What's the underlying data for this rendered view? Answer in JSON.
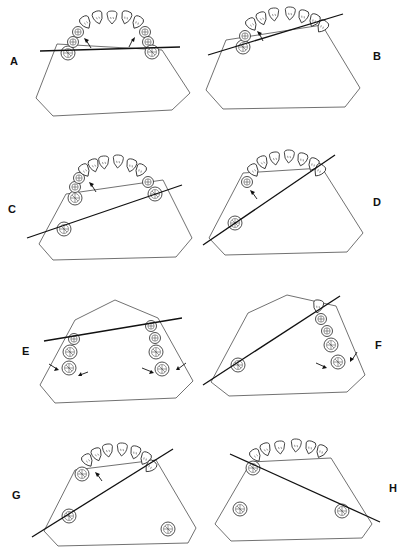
{
  "figure": {
    "panels": [
      {
        "id": "A",
        "label": "A",
        "position": "top-left",
        "line_from": [
          40,
          51
        ],
        "line_to": [
          180,
          47
        ],
        "arrows": 2,
        "arch": "full"
      },
      {
        "id": "B",
        "label": "B",
        "position": "top-right",
        "line_from": [
          208,
          55
        ],
        "line_to": [
          343,
          14
        ],
        "arrows": 1,
        "arch": "full"
      },
      {
        "id": "C",
        "label": "C",
        "position": "row2-left",
        "line_from": [
          27,
          238
        ],
        "line_to": [
          182,
          185
        ],
        "arrows": 1,
        "arch": "full-with-isolated-molar"
      },
      {
        "id": "D",
        "label": "D",
        "position": "row2-right",
        "line_from": [
          203,
          245
        ],
        "line_to": [
          335,
          155
        ],
        "arrows": 1,
        "arch": "anterior-with-isolated-molar"
      },
      {
        "id": "E",
        "label": "E",
        "position": "row3-left",
        "line_from": [
          44,
          341
        ],
        "line_to": [
          182,
          318
        ],
        "arrows": 4,
        "arch": "bilateral-posterior-segments"
      },
      {
        "id": "F",
        "label": "F",
        "position": "row3-right",
        "line_from": [
          203,
          385
        ],
        "line_to": [
          340,
          296
        ],
        "arrows": 2,
        "arch": "unilateral-posterior-with-isolated-molar"
      },
      {
        "id": "G",
        "label": "G",
        "position": "bottom-left",
        "line_from": [
          32,
          537
        ],
        "line_to": [
          173,
          449
        ],
        "arrows": 1,
        "arch": "anterior-with-two-isolated-molars"
      },
      {
        "id": "H",
        "label": "H",
        "position": "bottom-right",
        "line_from": [
          230,
          454
        ],
        "line_to": [
          380,
          522
        ],
        "arrows": 0,
        "arch": "anterior-with-two-isolated-molars"
      }
    ]
  },
  "labels": {
    "A": "A",
    "B": "B",
    "C": "C",
    "D": "D",
    "E": "E",
    "F": "F",
    "G": "G",
    "H": "H"
  },
  "colors": {
    "background": "#ffffff",
    "ink": "#111111",
    "outline": "#333333"
  }
}
